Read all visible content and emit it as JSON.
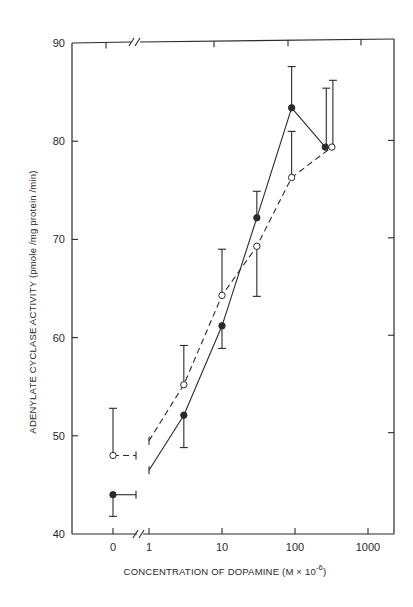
{
  "chart_data": {
    "type": "line",
    "title": "",
    "xlabel": "CONCENTRATION OF DOPAMINE (M × 10⁻⁶)",
    "xlabel_main": "CONCENTRATION OF DOPAMINE (M × 10",
    "xlabel_exp": "-6",
    "xlabel_close": ")",
    "ylabel": "ADENYLATE CYCLASE ACTIVITY (pmole /mg protein /min)",
    "x_scale": "log (with axis break between 0 and 1)",
    "x_ticks": [
      "0",
      "1",
      "10",
      "100",
      "1000"
    ],
    "y_ticks": [
      "40",
      "50",
      "60",
      "70",
      "80",
      "90"
    ],
    "ylim": [
      40,
      90
    ],
    "xlim": [
      0,
      2000
    ],
    "grid": false,
    "legend": "none (series distinguished by marker: filled circle/solid line vs open circle/dashed line)",
    "series": [
      {
        "name": "filled circles (solid line)",
        "marker": "filled-circle",
        "line_style": "solid",
        "points": [
          {
            "x": 0,
            "y": 44.0,
            "err_low": 41.8,
            "err_high": null,
            "err_right": true
          },
          {
            "x": 3,
            "y": 52.1,
            "err_low": 48.8,
            "err_high": null
          },
          {
            "x": 10,
            "y": 61.2,
            "err_low": 58.9,
            "err_high": null
          },
          {
            "x": 30,
            "y": 72.2,
            "err_low": null,
            "err_high": 74.9
          },
          {
            "x": 90,
            "y": 83.4,
            "err_low": null,
            "err_high": 87.6
          },
          {
            "x": 260,
            "y": 79.4,
            "err_low": null,
            "err_high": 85.4
          }
        ]
      },
      {
        "name": "open circles (dashed line)",
        "marker": "open-circle",
        "line_style": "dashed",
        "points": [
          {
            "x": 0,
            "y": 48.0,
            "err_low": null,
            "err_high": 52.8,
            "err_right": true
          },
          {
            "x": 3,
            "y": 55.2,
            "err_low": null,
            "err_high": 59.2
          },
          {
            "x": 10,
            "y": 64.3,
            "err_low": null,
            "err_high": 69.0
          },
          {
            "x": 30,
            "y": 69.3,
            "err_low": 64.2,
            "err_high": null
          },
          {
            "x": 90,
            "y": 76.3,
            "err_low": null,
            "err_high": 81.0
          },
          {
            "x": 320,
            "y": 79.4,
            "err_low": null,
            "err_high": 86.2
          }
        ]
      }
    ]
  },
  "layout": {
    "plot_left": 72,
    "plot_right": 394,
    "plot_top": 43,
    "plot_bottom": 534,
    "x_zero_px": 113,
    "x_one_px": 149,
    "px_per_decade": 73,
    "line_color": "#2a2a2a"
  }
}
